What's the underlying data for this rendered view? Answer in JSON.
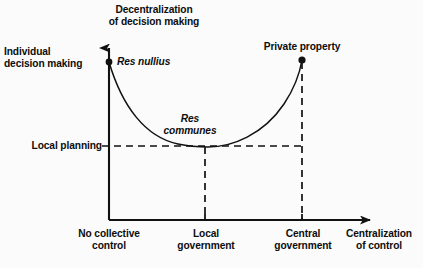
{
  "figure": {
    "type": "diagram",
    "background_color": "#fbfbfb",
    "ink_color": "#111111",
    "axes": {
      "y_axis_top_label": "Decentralization\nof decision making",
      "y_axis_bottom_context_label": "Individual\ndecision making",
      "x_axis_end_label": "Centralization\nof control",
      "origin_px": [
        109,
        220
      ],
      "y_top_px": 43,
      "x_right_px": 378
    },
    "labels": {
      "title_decentralization": "Decentralization\nof decision making",
      "individual_decision_making": "Individual\ndecision making",
      "res_nullius": "Res nullius",
      "res_communes": "Res\ncommunes",
      "private_property": "Private property",
      "local_planning": "Local planning",
      "no_collective_control": "No collective\ncontrol",
      "local_government": "Local\ngovernment",
      "central_government": "Central\ngovernment",
      "centralization_of_control": "Centralization\nof control"
    },
    "points": [
      {
        "name": "res-nullius",
        "label": "Res nullius",
        "x_px": 109,
        "y_px": 62,
        "marker": "filled-dot"
      },
      {
        "name": "private-property",
        "label": "Private property",
        "x_px": 302,
        "y_px": 60,
        "marker": "filled-dot"
      }
    ],
    "curve": {
      "shape": "u-shaped",
      "description": "Steeply falling convex curve from Res nullius at the y-axis, flattening to a minimum at the Local planning level near Local government, then rising steeply to Private property at Central government.",
      "minimum_level_label": "Local planning",
      "minimum_y_px": 147,
      "path": "M 109 62 C 128 122, 158 144, 205 147 C 252 150, 288 118, 302 60"
    },
    "guide_lines": [
      {
        "name": "local-planning-guide",
        "orientation": "horizontal",
        "style": "dashed",
        "from_px": [
          104,
          146
        ],
        "to_px": [
          302,
          146
        ]
      },
      {
        "name": "local-government-guide",
        "orientation": "vertical",
        "style": "dashed",
        "from_px": [
          205,
          146
        ],
        "to_px": [
          205,
          220
        ]
      },
      {
        "name": "central-government-guide",
        "orientation": "vertical",
        "style": "dashed",
        "from_px": [
          302,
          60
        ],
        "to_px": [
          302,
          220
        ]
      }
    ],
    "ticks": [
      {
        "name": "tick-no-collective-control",
        "x_px": 109
      },
      {
        "name": "tick-local-government",
        "x_px": 205
      },
      {
        "name": "tick-central-government",
        "x_px": 302
      }
    ]
  }
}
